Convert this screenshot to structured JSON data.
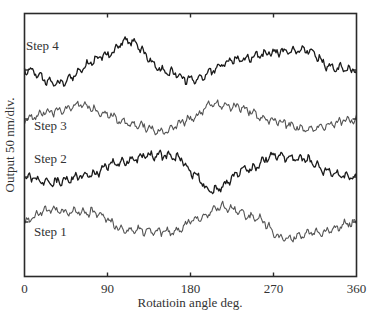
{
  "chart_data": {
    "type": "line",
    "title": "",
    "xlabel": "Rotatioin angle deg.",
    "ylabel": "Output 50 nm/div.",
    "xlim": [
      0,
      360
    ],
    "xticks": [
      0,
      90,
      180,
      270,
      360
    ],
    "xtick_labels": [
      "0",
      "90",
      "180",
      "270",
      "360"
    ],
    "y_scale": "50 nm per division (traces vertically offset)",
    "grid": false,
    "legend": "inline labels",
    "series": [
      {
        "name": "Step 4",
        "color": "#1a1a1a",
        "offset_px": 70,
        "label_pos": [
          26,
          50
        ],
        "shape_x": [
          0,
          35,
          90,
          110,
          155,
          180,
          230,
          270,
          305,
          335,
          360
        ],
        "shape_y_px": [
          0,
          13,
          -15,
          -30,
          2,
          10,
          -10,
          -18,
          -20,
          -2,
          0
        ],
        "noise_px": 5
      },
      {
        "name": "Step 3",
        "color": "#555555",
        "offset_px": 119,
        "label_pos": [
          34,
          130
        ],
        "shape_x": [
          0,
          30,
          60,
          90,
          110,
          150,
          180,
          205,
          230,
          270,
          310,
          360
        ],
        "shape_y_px": [
          0,
          -8,
          -14,
          -5,
          4,
          12,
          0,
          -15,
          -12,
          2,
          10,
          0
        ],
        "noise_px": 5
      },
      {
        "name": "Step 2",
        "color": "#1a1a1a",
        "offset_px": 177,
        "label_pos": [
          34,
          163
        ],
        "shape_x": [
          0,
          30,
          70,
          100,
          140,
          165,
          185,
          200,
          245,
          270,
          300,
          340,
          360
        ],
        "shape_y_px": [
          0,
          5,
          -2,
          -14,
          -22,
          -20,
          -2,
          14,
          -8,
          -22,
          -18,
          -2,
          0
        ],
        "noise_px": 5
      },
      {
        "name": "Step 1",
        "color": "#555555",
        "offset_px": 222,
        "label_pos": [
          34,
          236
        ],
        "shape_x": [
          0,
          25,
          50,
          75,
          110,
          160,
          185,
          215,
          250,
          280,
          320,
          360
        ],
        "shape_y_px": [
          0,
          -12,
          -10,
          -10,
          8,
          10,
          -2,
          -15,
          -5,
          16,
          10,
          0
        ],
        "noise_px": 5
      }
    ]
  }
}
